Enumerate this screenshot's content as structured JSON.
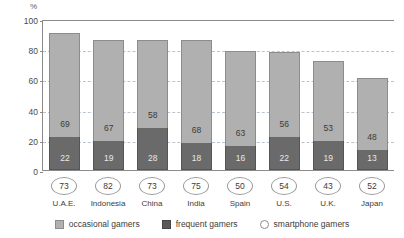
{
  "chart_data": {
    "type": "bar",
    "subtype": "stacked-bar-with-annotations",
    "title": "",
    "xlabel": "",
    "ylabel": "%",
    "ylim": [
      0,
      100
    ],
    "yticks": [
      0,
      20,
      40,
      60,
      80,
      100
    ],
    "grid": true,
    "legend_position": "bottom",
    "categories": [
      "U.A.E.",
      "Indonesia",
      "China",
      "India",
      "Spain",
      "U.S.",
      "U.K.",
      "Japan"
    ],
    "series": [
      {
        "name": "frequent gamers",
        "color": "#6a6a6a",
        "values": [
          22,
          19,
          28,
          18,
          16,
          22,
          19,
          13
        ]
      },
      {
        "name": "occasional gamers",
        "color": "#b0b0b0",
        "values": [
          69,
          67,
          58,
          68,
          63,
          56,
          53,
          48
        ]
      }
    ],
    "annotation_series": {
      "name": "smartphone gamers",
      "marker": "circle",
      "values": [
        73,
        82,
        73,
        75,
        50,
        54,
        43,
        52
      ]
    },
    "totals": [
      91,
      86,
      86,
      86,
      79,
      78,
      72,
      61
    ]
  },
  "axis": {
    "unit_label": "%",
    "ticks": [
      "100",
      "80",
      "60",
      "40",
      "20",
      "0"
    ]
  },
  "legend": {
    "items": [
      {
        "key": "occasional",
        "label": "occasional gamers",
        "color": "#b0b0b0",
        "marker": "square"
      },
      {
        "key": "frequent",
        "label": "frequent gamers",
        "color": "#595959",
        "marker": "square"
      },
      {
        "key": "smartphone",
        "label": "smartphone gamers",
        "color": "#ffffff",
        "marker": "circle"
      }
    ]
  },
  "colors": {
    "occasional": "#b0b0b0",
    "frequent": "#6a6a6a",
    "axis": "#8a8a8a",
    "gridline": "#b9c4cf",
    "background": "#ffffff"
  }
}
